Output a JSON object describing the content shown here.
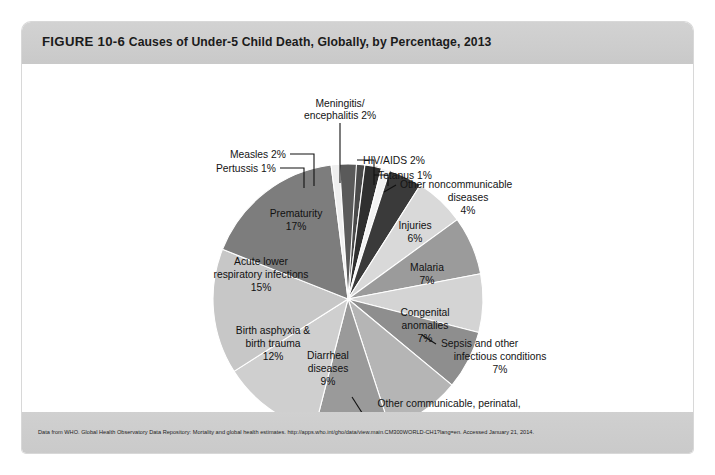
{
  "figure": {
    "number": "FIGURE 10-6",
    "caption": "Causes of Under-5 Child Death, Globally, by Percentage, 2013",
    "source": "Data from WHO. Global Health Observatory Data Repository: Mortality and global health estimates. http://apps.who.int/gho/data/view.main.CM300WORLD-CH1?lang=en. Accessed January 21, 2014."
  },
  "chart_data": {
    "type": "pie",
    "title": "Causes of Under-5 Child Death, Globally, by Percentage, 2013",
    "unit": "percent",
    "total": 100,
    "legend_position": "none",
    "grid": false,
    "start_angle_deg": -90,
    "direction": "clockwise",
    "categories": [
      "Meningitis/encephalitis",
      "HIV/AIDS",
      "Tetanus",
      "Other noncommunicable diseases",
      "Injuries",
      "Malaria",
      "Congenital anomalies",
      "Sepsis and other infectious conditions",
      "Other communicable, perinatal, and nutritional conditions",
      "Diarrheal diseases",
      "Birth asphyxia & birth trauma",
      "Acute lower respiratory infections",
      "Prematurity",
      "Pertussis",
      "Measles"
    ],
    "values": [
      2,
      2,
      1,
      4,
      6,
      7,
      7,
      7,
      9,
      9,
      12,
      15,
      17,
      1,
      2
    ],
    "colors": [
      "#4a4a4a",
      "#2f2f2f",
      "#f2f2f2",
      "#3a3a3a",
      "#d9d9d9",
      "#9b9b9b",
      "#d4d4d4",
      "#8e8e8e",
      "#b5b5b5",
      "#9a9a9a",
      "#cfcfcf",
      "#c7c7c7",
      "#7d7d7d",
      "#efefef",
      "#5a5a5a"
    ],
    "slices": [
      {
        "label": "Meningitis/",
        "label_line2": "encephalitis 2%",
        "name": "Meningitis/encephalitis",
        "value": 2,
        "percent_text": "2%",
        "color": "#4a4a4a",
        "label_placement": "outside-callout"
      },
      {
        "label": "HIV/AIDS 2%",
        "name": "HIV/AIDS",
        "value": 2,
        "percent_text": "2%",
        "color": "#2f2f2f",
        "label_placement": "outside-callout"
      },
      {
        "label": "Tetanus 1%",
        "name": "Tetanus",
        "value": 1,
        "percent_text": "1%",
        "color": "#f2f2f2",
        "label_placement": "outside-callout"
      },
      {
        "label": "Other noncommunicable",
        "label_line2": "diseases",
        "label_line3": "4%",
        "name": "Other noncommunicable diseases",
        "value": 4,
        "percent_text": "4%",
        "color": "#3a3a3a",
        "label_placement": "outside-callout"
      },
      {
        "label": "Injuries",
        "label_line2": "6%",
        "name": "Injuries",
        "value": 6,
        "percent_text": "6%",
        "color": "#d9d9d9",
        "label_placement": "inside"
      },
      {
        "label": "Malaria",
        "label_line2": "7%",
        "name": "Malaria",
        "value": 7,
        "percent_text": "7%",
        "color": "#9b9b9b",
        "label_placement": "inside"
      },
      {
        "label": "Congenital",
        "label_line2": "anomalies",
        "label_line3": "7%",
        "name": "Congenital anomalies",
        "value": 7,
        "percent_text": "7%",
        "color": "#d4d4d4",
        "label_placement": "inside"
      },
      {
        "label": "Sepsis and other",
        "label_line2": "infectious conditions",
        "label_line3": "7%",
        "name": "Sepsis and other infectious conditions",
        "value": 7,
        "percent_text": "7%",
        "color": "#8e8e8e",
        "label_placement": "outside-callout"
      },
      {
        "label": "Other communicable, perinatal,",
        "label_line2": "and nutritional conditions",
        "label_line3": "9%",
        "name": "Other communicable, perinatal, and nutritional conditions",
        "value": 9,
        "percent_text": "9%",
        "color": "#b5b5b5",
        "label_placement": "outside-callout"
      },
      {
        "label": "Diarrheal",
        "label_line2": "diseases",
        "label_line3": "9%",
        "name": "Diarrheal diseases",
        "value": 9,
        "percent_text": "9%",
        "color": "#9a9a9a",
        "label_placement": "inside"
      },
      {
        "label": "Birth asphyxia &",
        "label_line2": "birth trauma",
        "label_line3": "12%",
        "name": "Birth asphyxia & birth trauma",
        "value": 12,
        "percent_text": "12%",
        "color": "#cfcfcf",
        "label_placement": "inside"
      },
      {
        "label": "Acute lower",
        "label_line2": "respiratory infections",
        "label_line3": "15%",
        "name": "Acute lower respiratory infections",
        "value": 15,
        "percent_text": "15%",
        "color": "#c7c7c7",
        "label_placement": "inside"
      },
      {
        "label": "Prematurity",
        "label_line2": "17%",
        "name": "Prematurity",
        "value": 17,
        "percent_text": "17%",
        "color": "#7d7d7d",
        "label_placement": "inside"
      },
      {
        "label": "Pertussis 1%",
        "name": "Pertussis",
        "value": 1,
        "percent_text": "1%",
        "color": "#efefef",
        "label_placement": "outside-callout"
      },
      {
        "label": "Measles 2%",
        "name": "Measles",
        "value": 2,
        "percent_text": "2%",
        "color": "#5a5a5a",
        "label_placement": "outside-callout"
      }
    ]
  },
  "labels": {
    "meningitis_l1": "Meningitis/",
    "meningitis_l2": "encephalitis 2%",
    "measles": "Measles 2%",
    "pertussis": "Pertussis 1%",
    "hivaids": "HIV/AIDS 2%",
    "tetanus": "Tetanus 1%",
    "noncomm_l1": "Other noncommunicable",
    "noncomm_l2": "diseases",
    "noncomm_l3": "4%",
    "injuries_l1": "Injuries",
    "injuries_l2": "6%",
    "malaria_l1": "Malaria",
    "malaria_l2": "7%",
    "congenital_l1": "Congenital",
    "congenital_l2": "anomalies",
    "congenital_l3": "7%",
    "sepsis_l1": "Sepsis and other",
    "sepsis_l2": "infectious conditions",
    "sepsis_l3": "7%",
    "othercomm_l1": "Other communicable, perinatal,",
    "othercomm_l2": "and nutritional conditions",
    "othercomm_l3": "9%",
    "diarrheal_l1": "Diarrheal",
    "diarrheal_l2": "diseases",
    "diarrheal_l3": "9%",
    "birth_l1": "Birth asphyxia &",
    "birth_l2": "birth trauma",
    "birth_l3": "12%",
    "alri_l1": "Acute lower",
    "alri_l2": "respiratory infections",
    "alri_l3": "15%",
    "prematurity_l1": "Prematurity",
    "prematurity_l2": "17%"
  }
}
